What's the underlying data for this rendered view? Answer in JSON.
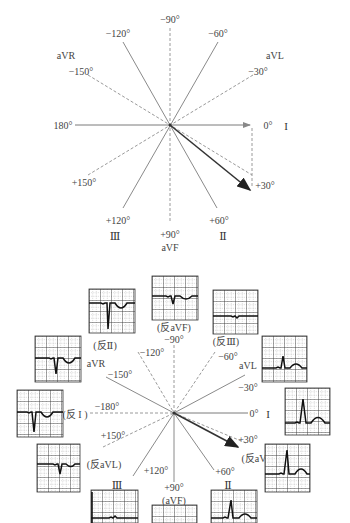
{
  "top_diagram": {
    "title": "Hexaxial reference system with mean QRS axis +30°",
    "labels": {
      "deg_0": "0°",
      "lead_I": "I",
      "deg_180": "180°",
      "deg_m90": "−90°",
      "deg_p90": "+90°",
      "lead_aVF": "aVF",
      "deg_m120": "−120°",
      "deg_m60": "−60°",
      "lead_aVR": "aVR",
      "deg_m150": "−150°",
      "lead_aVL": "aVL",
      "deg_m30": "−30°",
      "deg_p150": "+150°",
      "deg_p120": "+120°",
      "lead_III": "Ⅲ",
      "deg_p60": "+60°",
      "lead_II": "Ⅱ",
      "deg_p30": "+30°"
    },
    "axis_vector_degrees": 30
  },
  "bottom_diagram": {
    "title": "Twelve-position lead axes with ECG waveform samples",
    "labels": {
      "deg_0": "0°",
      "lead_I": "I",
      "deg_m180": "−180°",
      "lead_inv_I": "(反 I )",
      "deg_m90": "−90°",
      "lead_inv_aVF": "(反aVF)",
      "deg_m120": "−120°",
      "deg_m60": "−60°",
      "lead_inv_II": "(反Ⅱ)",
      "lead_inv_III": "(反Ⅲ)",
      "deg_m150": "−150°",
      "lead_aVR": "aVR",
      "deg_m30": "−30°",
      "lead_aVL": "aVL",
      "deg_p30": "+30°",
      "lead_inv_aVR": "(反aVR)",
      "deg_p60": "+60°",
      "lead_II": "Ⅱ",
      "deg_p120": "+120°",
      "lead_III": "Ⅲ",
      "deg_p90": "+90°",
      "lead_aVF": "(aVF)",
      "deg_p150": "+150°",
      "lead_inv_aVL": "(反aVL)"
    },
    "ecg_samples": [
      {
        "lead": "反Ⅱ",
        "morphology": "negative deep Q/S with inverted T"
      },
      {
        "lead": "反aVF",
        "morphology": "small negative deflection"
      },
      {
        "lead": "反Ⅲ",
        "morphology": "nearly flat"
      },
      {
        "lead": "aVR",
        "morphology": "negative QRS with inverted T"
      },
      {
        "lead": "aVL",
        "morphology": "small positive R with upright T"
      },
      {
        "lead": "反 I",
        "morphology": "negative QRS with inverted T"
      },
      {
        "lead": "I",
        "morphology": "tall positive R with upright T"
      },
      {
        "lead": "反aVL",
        "morphology": "small negative QRS"
      },
      {
        "lead": "反aVR",
        "morphology": "tall positive R with upright T"
      },
      {
        "lead": "Ⅲ",
        "morphology": "nearly flat"
      },
      {
        "lead": "aVF",
        "morphology": "small deflection"
      },
      {
        "lead": "Ⅱ",
        "morphology": "positive R with upright T"
      }
    ]
  }
}
